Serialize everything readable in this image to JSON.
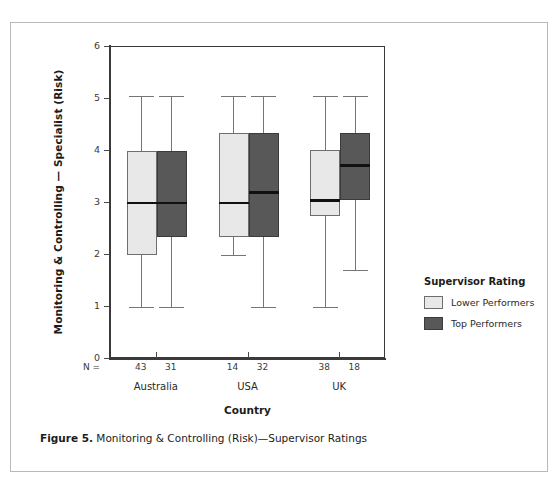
{
  "figure": {
    "caption_label": "Figure 5.",
    "caption_text": "Monitoring & Controlling (Risk)—Supervisor Ratings",
    "running_header": ""
  },
  "legend": {
    "title": "Supervisor Rating",
    "items": [
      {
        "label": "Lower Performers",
        "color": "#e8e8e8"
      },
      {
        "label": "Top Performers",
        "color": "#585858"
      }
    ]
  },
  "axes": {
    "y_title": "Monitoring & Controlling — Specialist (Risk)",
    "x_title": "Country",
    "n_prefix": "N =",
    "y_ticks": [
      "0",
      "1",
      "2",
      "3",
      "4",
      "5",
      "6"
    ]
  },
  "chart_data": {
    "type": "box",
    "title": "Monitoring & Controlling (Risk)—Supervisor Ratings",
    "xlabel": "Country",
    "ylabel": "Monitoring & Controlling — Specialist (Risk)",
    "ylim": [
      0,
      6
    ],
    "yticks": [
      0,
      1,
      2,
      3,
      4,
      5,
      6
    ],
    "grid": false,
    "legend_position": "right",
    "categories": [
      "Australia",
      "USA",
      "UK"
    ],
    "series": [
      {
        "name": "Lower Performers",
        "color": "#e8e8e8",
        "boxes": [
          {
            "category": "Australia",
            "n": 43,
            "whisker_low": 1.0,
            "q1": 2.0,
            "median": 3.0,
            "q3": 4.0,
            "whisker_high": 5.05
          },
          {
            "category": "USA",
            "n": 14,
            "whisker_low": 2.0,
            "q1": 2.35,
            "median": 3.0,
            "q3": 4.35,
            "whisker_high": 5.05
          },
          {
            "category": "UK",
            "n": 38,
            "whisker_low": 1.0,
            "q1": 2.75,
            "median": 3.05,
            "q3": 4.02,
            "whisker_high": 5.05
          }
        ]
      },
      {
        "name": "Top Performers",
        "color": "#585858",
        "boxes": [
          {
            "category": "Australia",
            "n": 31,
            "whisker_low": 1.0,
            "q1": 2.35,
            "median": 3.0,
            "q3": 4.0,
            "whisker_high": 5.05
          },
          {
            "category": "USA",
            "n": 32,
            "whisker_low": 1.0,
            "q1": 2.35,
            "median": 3.2,
            "q3": 4.35,
            "whisker_high": 5.05
          },
          {
            "category": "UK",
            "n": 18,
            "whisker_low": 1.72,
            "q1": 3.05,
            "median": 3.72,
            "q3": 4.35,
            "whisker_high": 5.05
          }
        ]
      }
    ]
  }
}
